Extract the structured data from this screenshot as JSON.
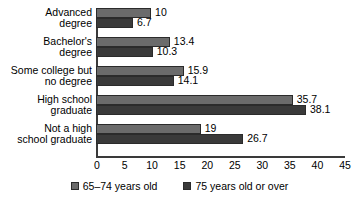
{
  "chart_data": {
    "type": "bar",
    "orientation": "horizontal",
    "title": "",
    "subtitle": "",
    "xlabel": "",
    "ylabel": "",
    "xlim": [
      0,
      45
    ],
    "xticks": [
      0,
      5,
      10,
      15,
      20,
      25,
      30,
      35,
      40,
      45
    ],
    "grid": false,
    "legend_position": "bottom-center",
    "categories": [
      "Advanced degree",
      "Bachelor's degree",
      "Some college but no degree",
      "High school graduate",
      "Not a high school graduate"
    ],
    "category_lines": [
      [
        "Advanced",
        "degree"
      ],
      [
        "Bachelor's",
        "degree"
      ],
      [
        "Some college but",
        "no degree"
      ],
      [
        "High school",
        "graduate"
      ],
      [
        "Not a high",
        "school graduate"
      ]
    ],
    "series": [
      {
        "name": "65–74 years old",
        "color": "#6b6b6b",
        "values": [
          10,
          13.4,
          15.9,
          35.7,
          19
        ],
        "value_labels": [
          "10",
          "13.4",
          "15.9",
          "35.7",
          "19"
        ]
      },
      {
        "name": "75 years old or over",
        "color": "#3a3a3a",
        "values": [
          6.7,
          10.3,
          14.1,
          38.1,
          26.7
        ],
        "value_labels": [
          "6.7",
          "10.3",
          "14.1",
          "38.1",
          "26.7"
        ]
      }
    ]
  },
  "colors": {
    "axis": "#3a3a3a",
    "bar_outline": "#2b2b2b",
    "series_65_74": "#6b6b6b",
    "series_75_over": "#3a3a3a",
    "background": "#ffffff",
    "text": "#000000"
  }
}
